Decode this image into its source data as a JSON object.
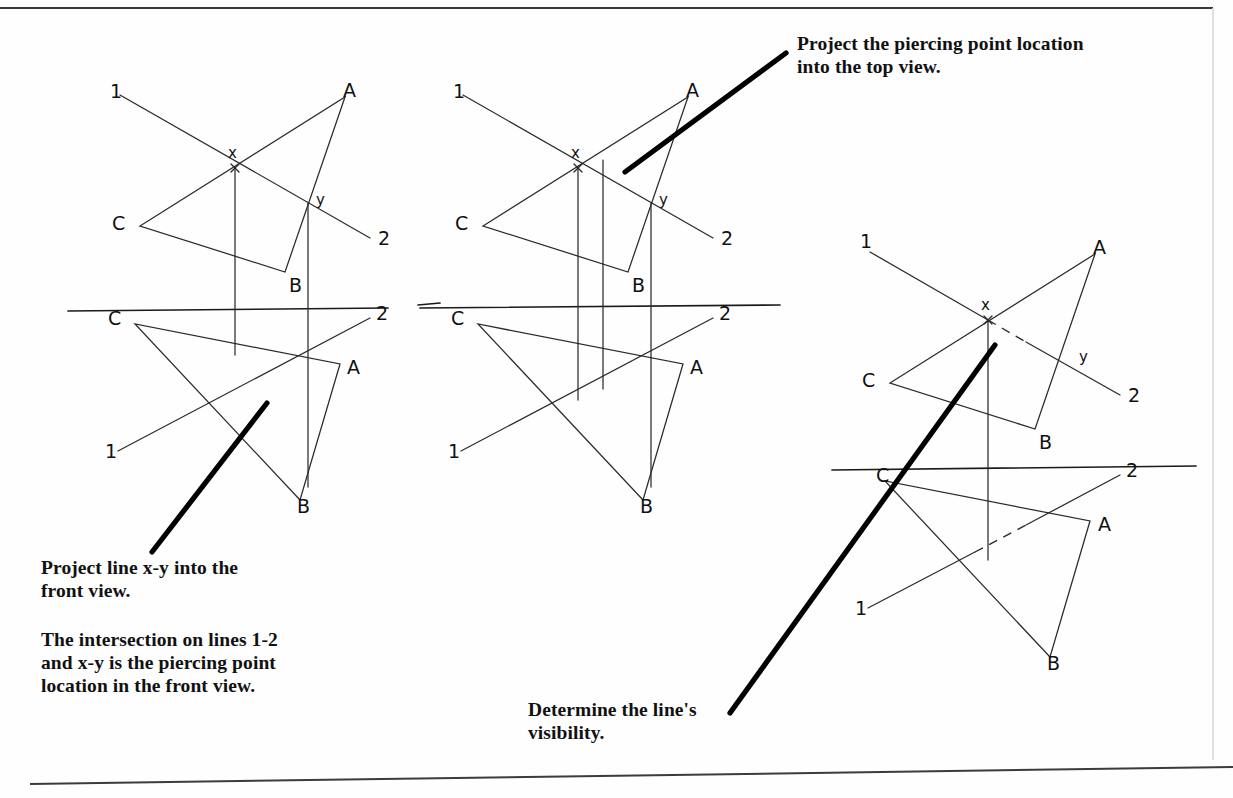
{
  "document": {
    "title": "Piercing point by line projection - orthographic views",
    "background_color": "#fefefe",
    "ink_color": "#1a1a1a",
    "pointer_color": "#000000",
    "width": 1233,
    "height": 798
  },
  "notes": {
    "top_right": "Project the piercing point location\ninto the top view.",
    "project_xy": "Project line x-y into the\nfront view.",
    "intersection": "The intersection on lines 1-2\nand x-y is the piercing point\nlocation in the front view.",
    "visibility": "Determine the line's\nvisibility."
  },
  "labels": {
    "point_a": "A",
    "point_b": "B",
    "point_c": "C",
    "point_x": "x",
    "point_y": "y",
    "line_end_1": "1",
    "line_end_2": "2"
  },
  "figures": [
    {
      "id": "figure-1",
      "name": "step-1-project-xy-into-front-view",
      "reference_line_y": 311,
      "top_view": {
        "triangle": {
          "a": [
            345,
            97
          ],
          "b": [
            285,
            272
          ],
          "c": [
            140,
            226
          ]
        },
        "line_1_2": {
          "start": [
            120,
            95
          ],
          "end": [
            370,
            238
          ]
        },
        "piercing_marks": {
          "x": [
            235,
            168
          ],
          "y": [
            308,
            203
          ]
        },
        "labels": {
          "A": [
            343,
            91
          ],
          "B": [
            289,
            286
          ],
          "C": [
            127,
            222
          ],
          "x": [
            230,
            155
          ],
          "y": [
            316,
            199
          ],
          "1": [
            112,
            91
          ],
          "2": [
            378,
            238
          ]
        }
      },
      "front_view": {
        "triangle": {
          "a": [
            340,
            364
          ],
          "b": [
            300,
            500
          ],
          "c": [
            135,
            324
          ]
        },
        "line_1_2": {
          "start": [
            118,
            451
          ],
          "end": [
            370,
            318
          ]
        },
        "labels": {
          "A": [
            349,
            366
          ],
          "B": [
            301,
            505
          ],
          "C": [
            117,
            318
          ],
          "1": [
            110,
            451
          ],
          "2": [
            376,
            314
          ]
        }
      },
      "projection_lines": [
        {
          "from": [
            235,
            168
          ],
          "to": [
            235,
            355
          ]
        },
        {
          "from": [
            308,
            203
          ],
          "to": [
            308,
            487
          ]
        }
      ],
      "pointer": {
        "from": [
          152,
          552
        ],
        "to": [
          267,
          403
        ],
        "target_note": "project_xy"
      }
    },
    {
      "id": "figure-2",
      "name": "step-2-project-piercing-point-into-top-view",
      "reference_line_y": 311,
      "top_view": {
        "triangle": {
          "a": [
            688,
            97
          ],
          "b": [
            628,
            272
          ],
          "c": [
            483,
            226
          ]
        },
        "line_1_2": {
          "start": [
            463,
            95
          ],
          "end": [
            713,
            238
          ]
        },
        "piercing_marks": {
          "x": [
            578,
            168
          ],
          "y": [
            651,
            203
          ]
        },
        "labels": {
          "A": [
            686,
            91
          ],
          "B": [
            632,
            286
          ],
          "C": [
            470,
            222
          ],
          "x": [
            573,
            155
          ],
          "y": [
            659,
            199
          ],
          "1": [
            455,
            91
          ],
          "2": [
            721,
            238
          ]
        }
      },
      "front_view": {
        "triangle": {
          "a": [
            683,
            364
          ],
          "b": [
            643,
            500
          ],
          "c": [
            478,
            324
          ]
        },
        "line_1_2": {
          "start": [
            461,
            451
          ],
          "end": [
            713,
            318
          ]
        },
        "labels": {
          "A": [
            692,
            366
          ],
          "B": [
            644,
            505
          ],
          "C": [
            460,
            318
          ],
          "1": [
            453,
            451
          ],
          "2": [
            719,
            314
          ]
        }
      },
      "projection_lines": [
        {
          "from": [
            578,
            168
          ],
          "to": [
            578,
            400
          ]
        },
        {
          "from": [
            603,
            160
          ],
          "to": [
            603,
            389
          ]
        },
        {
          "from": [
            651,
            203
          ],
          "to": [
            651,
            487
          ]
        }
      ],
      "pointer": {
        "from": [
          625,
          172
        ],
        "to": [
          786,
          53
        ],
        "target_note": "top_right"
      }
    },
    {
      "id": "figure-3",
      "name": "step-3-determine-visibility",
      "reference_line_y": 468,
      "top_view": {
        "triangle": {
          "a": [
            1095,
            254
          ],
          "b": [
            1035,
            429
          ],
          "c": [
            890,
            383
          ]
        },
        "line_1_2_visible_a": {
          "start": [
            870,
            252
          ],
          "end": [
            988,
            320
          ]
        },
        "line_1_2_hidden": {
          "start": [
            988,
            320
          ],
          "end": [
            1022,
            339
          ]
        },
        "line_1_2_visible_b": {
          "start": [
            1022,
            339
          ],
          "end": [
            1120,
            395
          ]
        },
        "piercing_marks": {
          "x": [
            988,
            320
          ],
          "y": [
            1071,
            357
          ]
        },
        "labels": {
          "A": [
            1093,
            248
          ],
          "B": [
            1039,
            443
          ],
          "C": [
            877,
            379
          ],
          "x": [
            983,
            312
          ],
          "y": [
            1079,
            356
          ],
          "1": [
            862,
            248
          ],
          "2": [
            1128,
            395
          ]
        }
      },
      "front_view": {
        "triangle": {
          "a": [
            1090,
            521
          ],
          "b": [
            1050,
            657
          ],
          "c": [
            885,
            481
          ]
        },
        "line_1_2_visible_a": {
          "start": [
            868,
            608
          ],
          "end": [
            975,
            552
          ]
        },
        "line_1_2_hidden": {
          "start": [
            975,
            552
          ],
          "end": [
            1025,
            525
          ]
        },
        "line_1_2_visible_b": {
          "start": [
            1025,
            525
          ],
          "end": [
            1120,
            475
          ]
        },
        "labels": {
          "A": [
            1099,
            523
          ],
          "B": [
            1051,
            662
          ],
          "C": [
            880,
            478
          ],
          "1": [
            860,
            608
          ],
          "2": [
            1126,
            471
          ]
        }
      },
      "projection_lines": [
        {
          "from": [
            988,
            320
          ],
          "to": [
            988,
            560
          ]
        }
      ],
      "pointer": {
        "from": [
          730,
          713
        ],
        "to": [
          995,
          345
        ],
        "target_note": "visibility"
      }
    }
  ],
  "page_borders": {
    "top": {
      "from": [
        0,
        8
      ],
      "to": [
        1213,
        8
      ]
    },
    "bottom": {
      "from": [
        30,
        784
      ],
      "to": [
        1233,
        768
      ]
    },
    "right_edge_x": 1213
  }
}
